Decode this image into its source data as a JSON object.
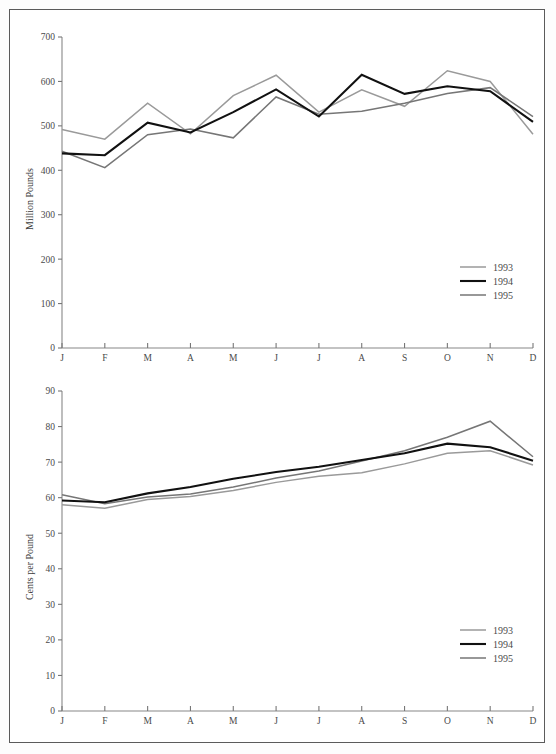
{
  "page": {
    "background_color": "#ffffff",
    "frame_color": "#5b5b5b"
  },
  "series_colors": {
    "1993": "#9a9a9a",
    "1994": "#111111",
    "1995": "#767676"
  },
  "series_widths": {
    "1993": 1.5,
    "1994": 2.1,
    "1995": 1.5
  },
  "legend": {
    "position": "bottom-right",
    "entries": [
      {
        "label": "1993",
        "color": "#9a9a9a",
        "width": 1.5
      },
      {
        "label": "1994",
        "color": "#111111",
        "width": 2.1
      },
      {
        "label": "1995",
        "color": "#767676",
        "width": 1.5
      }
    ]
  },
  "chart_data": [
    {
      "id": "chart-production",
      "type": "line",
      "title": "",
      "xlabel": "",
      "ylabel": "Million Pounds",
      "categories": [
        "J",
        "F",
        "M",
        "A",
        "M",
        "J",
        "J",
        "A",
        "S",
        "O",
        "N",
        "D"
      ],
      "month_names": [
        "January",
        "February",
        "March",
        "April",
        "May",
        "June",
        "July",
        "August",
        "September",
        "October",
        "November",
        "December"
      ],
      "ylim": [
        0,
        700
      ],
      "yticks": [
        0,
        100,
        200,
        300,
        400,
        500,
        600,
        700
      ],
      "ytick_labels": [
        "0",
        "100",
        "200",
        "300",
        "400",
        "500",
        "600",
        "700"
      ],
      "grid": false,
      "series": [
        {
          "name": "1993",
          "values": [
            492,
            470,
            551,
            482,
            568,
            614,
            531,
            581,
            544,
            624,
            600,
            481
          ]
        },
        {
          "name": "1994",
          "values": [
            438,
            434,
            507,
            485,
            531,
            582,
            521,
            615,
            572,
            589,
            578,
            509
          ]
        },
        {
          "name": "1995",
          "values": [
            443,
            406,
            480,
            493,
            473,
            565,
            526,
            533,
            551,
            573,
            586,
            521
          ]
        }
      ]
    },
    {
      "id": "chart-price",
      "type": "line",
      "title": "",
      "xlabel": "",
      "ylabel": "Cents per Pound",
      "categories": [
        "J",
        "F",
        "M",
        "A",
        "M",
        "J",
        "J",
        "A",
        "S",
        "O",
        "N",
        "D"
      ],
      "month_names": [
        "January",
        "February",
        "March",
        "April",
        "May",
        "June",
        "July",
        "August",
        "September",
        "October",
        "November",
        "December"
      ],
      "ylim": [
        0,
        90
      ],
      "yticks": [
        0,
        10,
        20,
        30,
        40,
        50,
        60,
        70,
        80,
        90
      ],
      "ytick_labels": [
        "0",
        "10",
        "20",
        "30",
        "40",
        "50",
        "60",
        "70",
        "80",
        "90"
      ],
      "grid": false,
      "series": [
        {
          "name": "1993",
          "values": [
            58.0,
            57.0,
            59.5,
            60.3,
            62.0,
            64.3,
            66.0,
            67.0,
            69.5,
            72.5,
            73.2,
            69.2
          ]
        },
        {
          "name": "1994",
          "values": [
            59.2,
            58.7,
            61.2,
            63.0,
            65.3,
            67.2,
            68.7,
            70.6,
            72.5,
            75.2,
            74.2,
            70.4
          ]
        },
        {
          "name": "1995",
          "values": [
            60.8,
            58.3,
            60.2,
            61.0,
            63.0,
            65.5,
            67.5,
            70.3,
            73.2,
            77.0,
            81.5,
            71.5
          ]
        }
      ]
    }
  ]
}
